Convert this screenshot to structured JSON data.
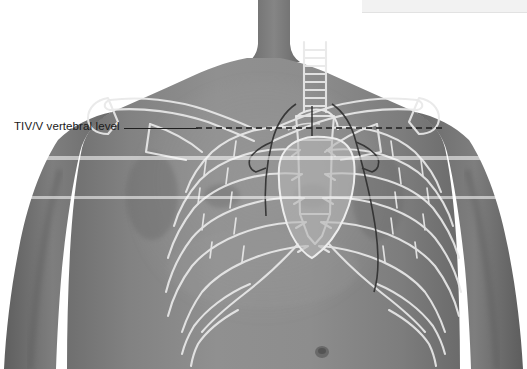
{
  "figure": {
    "view": "anterior",
    "background_color": "#ffffff",
    "skin_color": "#8a8a8a",
    "bone_outline_color": "#e8e8e8",
    "organ_outline_color": "#2b2b2b",
    "heart_fill_color": "#b0b0b0"
  },
  "annotation": {
    "label": "TIV/V vertebral level",
    "leader_line_color": "#1f1f1f",
    "plane_line_style": "dashed",
    "plane_line_color": "#2a2a2a"
  },
  "banner": {
    "text": ""
  },
  "structures": {
    "clavicle_left": "clavicle-left",
    "clavicle_right": "clavicle-right",
    "trachea": "trachea",
    "sternum": "sternum",
    "ribs": "rib-cage",
    "costal_margin": "costal-margin",
    "heart": "heart-silhouette",
    "lung_left": "lung-left-border",
    "lung_right": "lung-right-border",
    "scapula_left": "scapula-left",
    "scapula_right": "scapula-right",
    "umbilicus": "umbilicus"
  }
}
